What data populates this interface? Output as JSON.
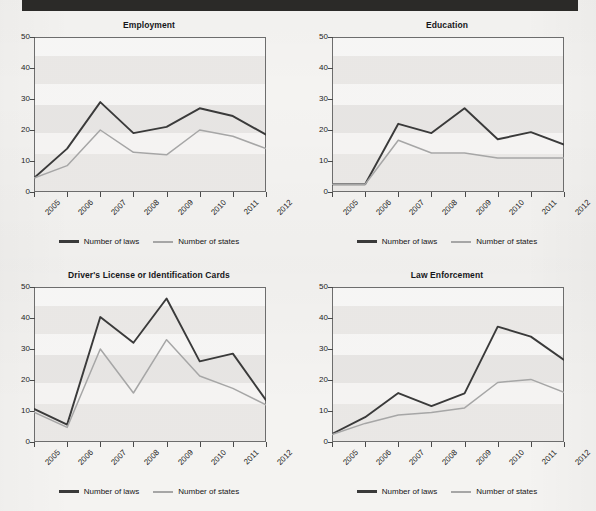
{
  "page": {
    "background_color": "#f4f3f1",
    "topbar_color": "#2b2a28"
  },
  "legend": {
    "laws_label": "Number of laws",
    "states_label": "Number of states",
    "laws_color": "#3a3a3a",
    "states_color": "#a6a6a6"
  },
  "axis": {
    "y_ticks": [
      "0",
      "10",
      "20",
      "30",
      "40",
      "50"
    ],
    "x_ticks": [
      "2005",
      "2006",
      "2007",
      "2008",
      "2009",
      "2010",
      "2011",
      "2012"
    ]
  },
  "chart_data": [
    {
      "type": "line",
      "panel": "top-left",
      "title": "Employment",
      "xlabel": "",
      "ylabel": "",
      "x": [
        "2005",
        "2006",
        "2007",
        "2008",
        "2009",
        "2010",
        "2011",
        "2012"
      ],
      "ylim": [
        0,
        50
      ],
      "yticks": [
        0,
        10,
        20,
        30,
        40,
        50
      ],
      "grid": false,
      "legend_position": "bottom-center",
      "series": [
        {
          "name": "Number of laws",
          "values": [
            4.5,
            14,
            29,
            19,
            21,
            27,
            24.5,
            18.5
          ]
        },
        {
          "name": "Number of states",
          "values": [
            4.5,
            8.5,
            20,
            12.8,
            12,
            20,
            18,
            14
          ]
        }
      ]
    },
    {
      "type": "line",
      "panel": "top-right",
      "title": "Education",
      "xlabel": "",
      "ylabel": "",
      "x": [
        "2005",
        "2006",
        "2007",
        "2008",
        "2009",
        "2010",
        "2011",
        "2012"
      ],
      "ylim": [
        0,
        50
      ],
      "yticks": [
        0,
        10,
        20,
        30,
        40,
        50
      ],
      "grid": false,
      "legend_position": "bottom-center",
      "series": [
        {
          "name": "Number of laws",
          "values": [
            2.5,
            2.5,
            22,
            19,
            27,
            17,
            19.3,
            15.3
          ]
        },
        {
          "name": "Number of states",
          "values": [
            2.5,
            2.5,
            16.7,
            12.6,
            12.6,
            11,
            11,
            11
          ]
        }
      ]
    },
    {
      "type": "line",
      "panel": "bottom-left",
      "title": "Driver's License or Identification Cards",
      "xlabel": "",
      "ylabel": "",
      "x": [
        "2005",
        "2006",
        "2007",
        "2008",
        "2009",
        "2010",
        "2011",
        "2012"
      ],
      "ylim": [
        0,
        50
      ],
      "yticks": [
        0,
        10,
        20,
        30,
        40,
        50
      ],
      "grid": false,
      "legend_position": "bottom-center",
      "series": [
        {
          "name": "Number of laws",
          "values": [
            10.7,
            5.6,
            40.3,
            32,
            46.3,
            26,
            28.5,
            13.5
          ]
        },
        {
          "name": "Number of states",
          "values": [
            9.6,
            4.7,
            30,
            15.8,
            33,
            21.3,
            17.3,
            12
          ]
        }
      ]
    },
    {
      "type": "line",
      "panel": "bottom-right",
      "title": "Law Enforcement",
      "xlabel": "",
      "ylabel": "",
      "x": [
        "2005",
        "2006",
        "2007",
        "2008",
        "2009",
        "2010",
        "2011",
        "2012"
      ],
      "ylim": [
        0,
        50
      ],
      "yticks": [
        0,
        10,
        20,
        30,
        40,
        50
      ],
      "grid": false,
      "legend_position": "bottom-center",
      "series": [
        {
          "name": "Number of laws",
          "values": [
            2.6,
            8,
            15.8,
            11.6,
            15.7,
            37.2,
            34,
            26.5
          ]
        },
        {
          "name": "Number of states",
          "values": [
            2.4,
            6,
            8.7,
            9.5,
            11,
            19.2,
            20.2,
            16
          ]
        }
      ]
    }
  ]
}
